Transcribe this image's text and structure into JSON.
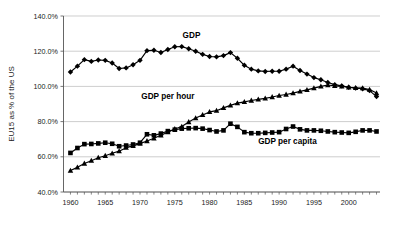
{
  "chart_data": {
    "type": "line",
    "title": "",
    "subtitle": "",
    "xlabel": "",
    "ylabel": "EU15 as % of the US",
    "xlim": [
      1959,
      2004.5
    ],
    "ylim": [
      40,
      140
    ],
    "y_tick_labels": [
      "140.0%",
      "120.0%",
      "100.0%",
      "80.0%",
      "60.0%",
      "40.0%"
    ],
    "y_tick_values": [
      140,
      120,
      100,
      80,
      60,
      40
    ],
    "x_tick_labels": [
      "1960",
      "1965",
      "1970",
      "1975",
      "1980",
      "1985",
      "1990",
      "1995",
      "2000"
    ],
    "x_tick_values": [
      1960,
      1965,
      1970,
      1975,
      1980,
      1985,
      1990,
      1995,
      2000
    ],
    "grid": "horizontal",
    "legend_position": "inline-annotations",
    "x": [
      1960,
      1961,
      1962,
      1963,
      1964,
      1965,
      1966,
      1967,
      1968,
      1969,
      1970,
      1971,
      1972,
      1973,
      1974,
      1975,
      1976,
      1977,
      1978,
      1979,
      1980,
      1981,
      1982,
      1983,
      1984,
      1985,
      1986,
      1987,
      1988,
      1989,
      1990,
      1991,
      1992,
      1993,
      1994,
      1995,
      1996,
      1997,
      1998,
      1999,
      2000,
      2001,
      2002,
      2003,
      2004
    ],
    "series": [
      {
        "name": "GDP",
        "marker": "diamond",
        "color": "#000000",
        "annotation": "GDP",
        "values": [
          108.2,
          111.5,
          115.2,
          114.2,
          115.0,
          114.8,
          113.3,
          110.2,
          110.5,
          112.3,
          114.8,
          120.3,
          120.5,
          119.3,
          121.0,
          122.5,
          122.6,
          121.4,
          120.0,
          118.2,
          117.0,
          116.8,
          117.5,
          119.2,
          116.0,
          112.0,
          109.8,
          108.8,
          108.5,
          108.6,
          108.6,
          109.8,
          111.5,
          109.0,
          107.0,
          105.0,
          103.8,
          102.2,
          101.0,
          100.3,
          99.5,
          99.0,
          98.7,
          97.6,
          94.2
        ]
      },
      {
        "name": "GDP per hour",
        "marker": "triangle",
        "color": "#000000",
        "annotation": "GDP per hour",
        "values": [
          52.2,
          54.0,
          56.2,
          57.8,
          59.5,
          60.6,
          62.0,
          63.2,
          65.2,
          66.2,
          67.5,
          69.0,
          70.5,
          72.2,
          74.0,
          75.8,
          77.2,
          79.8,
          82.0,
          83.8,
          85.5,
          86.2,
          87.8,
          89.2,
          90.5,
          91.2,
          92.0,
          92.6,
          93.2,
          94.0,
          94.8,
          95.4,
          96.2,
          97.2,
          98.0,
          99.0,
          100.0,
          100.8,
          100.3,
          100.0,
          99.5,
          99.2,
          99.0,
          98.2,
          96.2
        ]
      },
      {
        "name": "GDP per capita",
        "marker": "square",
        "color": "#000000",
        "annotation": "GDP per capita",
        "values": [
          62.2,
          65.0,
          67.2,
          67.3,
          67.6,
          68.0,
          67.4,
          66.0,
          66.4,
          67.0,
          68.0,
          72.8,
          72.2,
          73.2,
          74.6,
          75.4,
          76.0,
          76.2,
          76.3,
          76.0,
          75.2,
          74.4,
          75.0,
          78.8,
          77.0,
          74.0,
          73.4,
          73.4,
          73.6,
          73.8,
          74.0,
          75.8,
          77.2,
          75.6,
          75.0,
          75.0,
          74.8,
          74.4,
          74.0,
          73.8,
          73.6,
          74.2,
          75.0,
          75.0,
          74.4
        ]
      }
    ]
  }
}
